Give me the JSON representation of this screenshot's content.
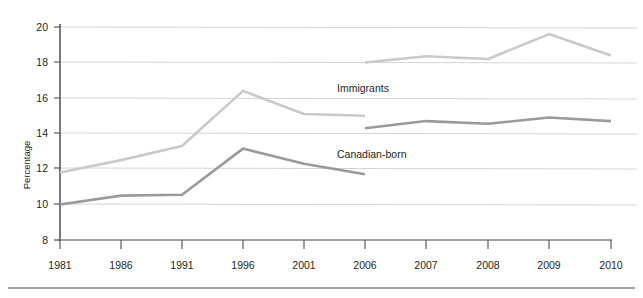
{
  "chart_data": {
    "type": "line",
    "title": "",
    "xlabel": "",
    "ylabel": "Percentage",
    "categories": [
      "1981",
      "1986",
      "1991",
      "1996",
      "2001",
      "2006",
      "2007",
      "2008",
      "2009",
      "2010"
    ],
    "ylim": [
      8,
      20
    ],
    "yticks": [
      8,
      10,
      12,
      14,
      16,
      18,
      20
    ],
    "ytick_labels": [
      "8",
      "10",
      "12",
      "14",
      "16",
      "18",
      "20"
    ],
    "grid": true,
    "legend_position": "inline-annotation",
    "series": [
      {
        "name": "Immigrants",
        "color": "#c9c9c9",
        "segments": [
          {
            "x": [
              "1981",
              "1986",
              "1991",
              "1996",
              "2001",
              "2006"
            ],
            "values": [
              11.8,
              12.5,
              13.3,
              16.4,
              15.1,
              15.0
            ]
          },
          {
            "x": [
              "2006",
              "2007",
              "2008",
              "2009",
              "2010"
            ],
            "values": [
              18.0,
              18.35,
              18.2,
              19.6,
              18.4
            ]
          }
        ]
      },
      {
        "name": "Canadian-born",
        "color": "#9a9a9a",
        "segments": [
          {
            "x": [
              "1981",
              "1986",
              "1991",
              "1996",
              "2001",
              "2006"
            ],
            "values": [
              10.0,
              10.5,
              10.55,
              13.15,
              12.3,
              11.7
            ]
          },
          {
            "x": [
              "2006",
              "2007",
              "2008",
              "2009",
              "2010"
            ],
            "values": [
              14.3,
              14.7,
              14.55,
              14.9,
              14.7
            ]
          }
        ]
      }
    ],
    "annotations": [
      {
        "text": "Immigrants",
        "x_px": 337,
        "y_px": 92
      },
      {
        "text": "Canadian-born",
        "x_px": 337,
        "y_px": 158
      }
    ]
  },
  "axis": {
    "y_title": "Percentage",
    "y_tick_0": "8",
    "y_tick_1": "10",
    "y_tick_2": "12",
    "y_tick_3": "14",
    "y_tick_4": "16",
    "y_tick_5": "18",
    "y_tick_6": "20",
    "x_tick_0": "1981",
    "x_tick_1": "1986",
    "x_tick_2": "1991",
    "x_tick_3": "1996",
    "x_tick_4": "2001",
    "x_tick_5": "2006",
    "x_tick_6": "2007",
    "x_tick_7": "2008",
    "x_tick_8": "2009",
    "x_tick_9": "2010"
  },
  "labels": {
    "immigrants": "Immigrants",
    "canadian_born": "Canadian-born"
  },
  "colors": {
    "immigrants_line": "#c9c9c9",
    "canadian_born_line": "#9a9a9a",
    "gridline": "#d4d4d4",
    "axis": "#58595b",
    "bottom_rule": "#808285",
    "text": "#231f20"
  }
}
